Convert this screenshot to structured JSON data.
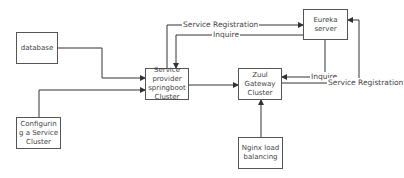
{
  "nodes": {
    "database": "database",
    "config": "Configurin g a Service Cluster",
    "service": "Service provider springboot Cluster",
    "zuul": "Zuul Gateway Cluster",
    "eureka": "Eureka server",
    "nginx": "Nginx load balancing"
  },
  "edges": {
    "service_registration_top": "Service Registration",
    "inquire_top": "Inquire",
    "inquire_zuul": "Inquire",
    "service_registration_zuul": "Service Registration"
  },
  "colors": {
    "line": "#333333",
    "text": "#444444",
    "border": "#555555"
  }
}
